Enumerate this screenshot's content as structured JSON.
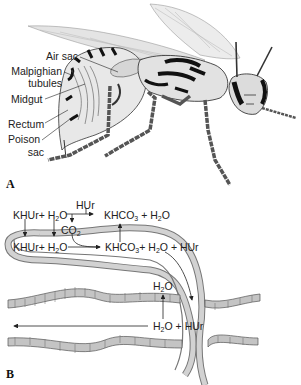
{
  "panel_a": {
    "letter": "A",
    "subject": "wasp",
    "labels": {
      "air_sac": "Air sac",
      "malpighian_1": "Malpighian",
      "malpighian_2": "tubules",
      "midgut": "Midgut",
      "rectum": "Rectum",
      "poison_1": "Poison",
      "poison_2": "sac"
    }
  },
  "panel_b": {
    "letter": "B",
    "top_reactants": {
      "khur": "KHUr",
      "plus": "+",
      "h2o_h": "H",
      "h2o_2": "2",
      "h2o_o": "O"
    },
    "hur_top": "HUr",
    "co2": {
      "c": "CO",
      "sub": "2"
    },
    "top_products": {
      "khco": "KHCO",
      "sub3": "3",
      "plus": " + H",
      "sub2": "2",
      "o": "O"
    },
    "tubule_reactants": {
      "khur": "KHUr",
      "plus": "+",
      "h": " H",
      "sub2": "2",
      "o": "O"
    },
    "tubule_products": {
      "khco": "KHCO",
      "sub3": "3",
      "plus": "+ H",
      "sub2": "2",
      "o": "O",
      "hur": "+ HUr"
    },
    "gut_water": {
      "h": "H",
      "sub2": "2",
      "o": "O"
    },
    "gut_products": {
      "h": "H",
      "sub2": "2",
      "o": "O",
      "hur": " + HUr"
    }
  },
  "colors": {
    "ink": "#222222",
    "tubule_fill": "#c9c9c9",
    "gut_fill": "#bdbdbd",
    "wing": "#e6e6e6"
  }
}
